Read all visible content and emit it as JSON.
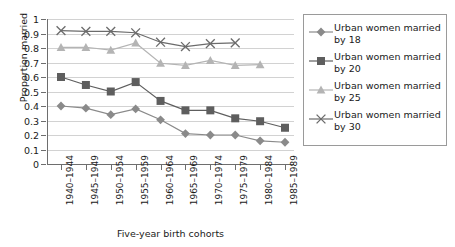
{
  "chart_data": {
    "type": "line",
    "title": "",
    "xlabel": "Five-year birth cohorts",
    "ylabel": "Proportion married",
    "categories": [
      "1940–1944",
      "1945–1949",
      "1950–1954",
      "1955–1959",
      "1960–1964",
      "1965–1969",
      "1970–1974",
      "1975–1979",
      "1980–1984",
      "1985–1989"
    ],
    "ylim": [
      0,
      1
    ],
    "yticks": [
      "0",
      "0.1",
      "0.2",
      "0.3",
      "0.4",
      "0.5",
      "0.6",
      "0.7",
      "0.8",
      "0.9",
      "1"
    ],
    "ytick_values": [
      0,
      0.1,
      0.2,
      0.3,
      0.4,
      0.5,
      0.6,
      0.7,
      0.8,
      0.9,
      1
    ],
    "grid": true,
    "legend_position": "right",
    "series": [
      {
        "name": "Urban women married by 18",
        "marker": "diamond",
        "color": "#8a8a8a",
        "line_color": "#8a8a8a",
        "values": [
          0.4,
          0.385,
          0.34,
          0.38,
          0.305,
          0.21,
          0.2,
          0.2,
          0.16,
          0.15
        ]
      },
      {
        "name": "Urban women married by 20",
        "marker": "square",
        "color": "#5e5e5e",
        "line_color": "#5e5e5e",
        "values": [
          0.6,
          0.545,
          0.5,
          0.565,
          0.435,
          0.37,
          0.37,
          0.315,
          0.295,
          0.25
        ]
      },
      {
        "name": "Urban women married by 25",
        "marker": "triangle",
        "color": "#b4b4b4",
        "line_color": "#b4b4b4",
        "values": [
          0.805,
          0.805,
          0.785,
          0.835,
          0.695,
          0.68,
          0.715,
          0.68,
          0.685,
          null
        ]
      },
      {
        "name": "Urban women married by 30",
        "marker": "x",
        "color": "#6b6b6b",
        "line_color": "#6b6b6b",
        "values": [
          0.92,
          0.915,
          0.915,
          0.905,
          0.84,
          0.81,
          0.83,
          0.835,
          null,
          null
        ]
      }
    ]
  },
  "legend": {
    "items": [
      {
        "label_line1": "Urban women married",
        "label_line2": "by 18"
      },
      {
        "label_line1": "Urban women married",
        "label_line2": "by 20"
      },
      {
        "label_line1": "Urban women married",
        "label_line2": "by 25"
      },
      {
        "label_line1": "Urban women married",
        "label_line2": "by 30"
      }
    ]
  }
}
